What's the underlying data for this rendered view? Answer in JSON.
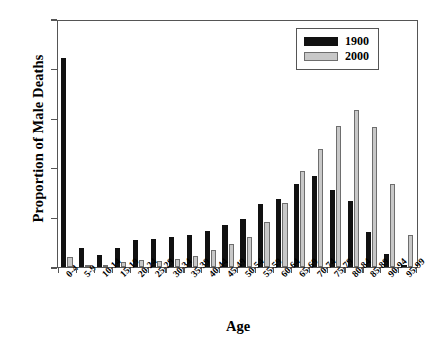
{
  "chart_data": {
    "type": "bar",
    "title": "",
    "xlabel": "Age",
    "ylabel": "Proportion of Male Deaths",
    "ylim": [
      0,
      0.25
    ],
    "yticks": [
      0.0,
      0.05,
      0.1,
      0.15,
      0.2,
      0.25
    ],
    "ytick_labels": [
      "0.00",
      "0.05",
      "0.10",
      "0.15",
      "0.20",
      "0.25"
    ],
    "grid": false,
    "legend_position": "top-right",
    "categories": [
      "0-4",
      "5-9",
      "10-14",
      "15-19",
      "20-24",
      "25-29",
      "30-34",
      "35-39",
      "40-44",
      "45-49",
      "50-54",
      "55-59",
      "60-64",
      "65-69",
      "70-74",
      "75-79",
      "80-84",
      "85-89",
      "90-94",
      "95-99"
    ],
    "series": [
      {
        "name": "1900",
        "color": "#111111",
        "values": [
          0.212,
          0.019,
          0.012,
          0.019,
          0.027,
          0.028,
          0.03,
          0.033,
          0.037,
          0.043,
          0.049,
          0.064,
          0.069,
          0.084,
          0.092,
          0.078,
          0.067,
          0.036,
          0.013,
          0.002
        ]
      },
      {
        "name": "2000",
        "color": "#c8c8c8",
        "values": [
          0.01,
          0.001,
          0.001,
          0.005,
          0.007,
          0.006,
          0.008,
          0.011,
          0.017,
          0.023,
          0.03,
          0.046,
          0.065,
          0.098,
          0.12,
          0.143,
          0.16,
          0.142,
          0.084,
          0.033
        ]
      }
    ]
  },
  "legend": {
    "entries": [
      {
        "label": "1900"
      },
      {
        "label": "2000"
      }
    ]
  }
}
